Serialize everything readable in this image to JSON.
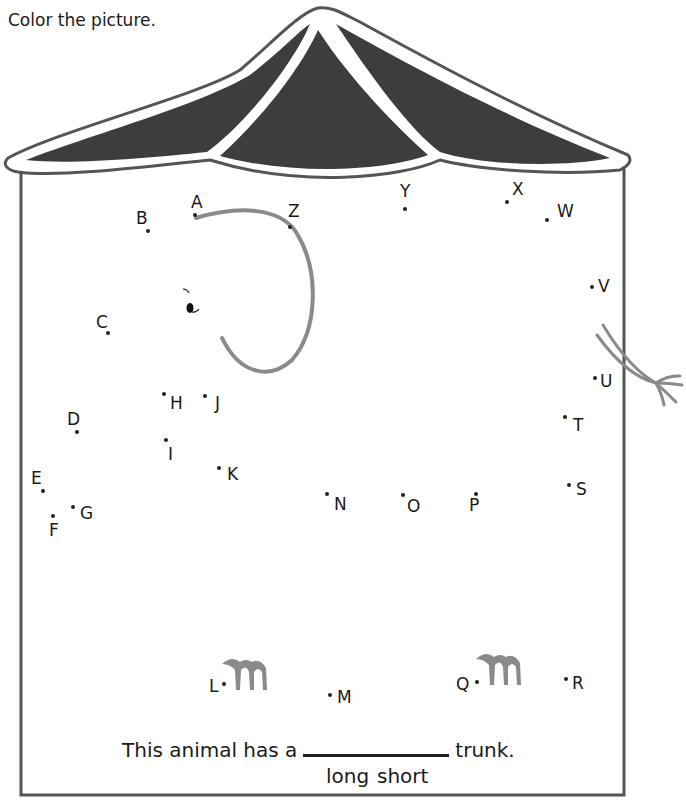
{
  "worksheet": {
    "instruction": "Color the picture.",
    "sentence": {
      "before": "This animal has a",
      "after": "trunk.",
      "choices": [
        "long",
        "short"
      ]
    },
    "colors": {
      "roof_fill": "#3d3d3d",
      "outline": "#555555",
      "trunk_gray": "#8a8a8a",
      "ink": "#1a1a1a"
    },
    "dots": [
      {
        "label": "A",
        "x": 195,
        "y": 215,
        "lx": 191,
        "ly": 194
      },
      {
        "label": "B",
        "x": 148,
        "y": 231,
        "lx": 136,
        "ly": 210
      },
      {
        "label": "C",
        "x": 108,
        "y": 333,
        "lx": 96,
        "ly": 314
      },
      {
        "label": "D",
        "x": 77,
        "y": 432,
        "lx": 67,
        "ly": 411
      },
      {
        "label": "E",
        "x": 43,
        "y": 491,
        "lx": 31,
        "ly": 470
      },
      {
        "label": "F",
        "x": 53,
        "y": 516,
        "lx": 49,
        "ly": 522
      },
      {
        "label": "G",
        "x": 73,
        "y": 507,
        "lx": 80,
        "ly": 505
      },
      {
        "label": "H",
        "x": 164,
        "y": 394,
        "lx": 170,
        "ly": 395
      },
      {
        "label": "I",
        "x": 166,
        "y": 440,
        "lx": 168,
        "ly": 446
      },
      {
        "label": "J",
        "x": 205,
        "y": 396,
        "lx": 215,
        "ly": 395
      },
      {
        "label": "K",
        "x": 219,
        "y": 468,
        "lx": 227,
        "ly": 466
      },
      {
        "label": "L",
        "x": 224,
        "y": 684,
        "lx": 209,
        "ly": 678
      },
      {
        "label": "M",
        "x": 330,
        "y": 695,
        "lx": 337,
        "ly": 689
      },
      {
        "label": "N",
        "x": 327,
        "y": 494,
        "lx": 334,
        "ly": 496
      },
      {
        "label": "O",
        "x": 403,
        "y": 495,
        "lx": 407,
        "ly": 498
      },
      {
        "label": "P",
        "x": 476,
        "y": 494,
        "lx": 469,
        "ly": 497
      },
      {
        "label": "Q",
        "x": 477,
        "y": 682,
        "lx": 456,
        "ly": 676
      },
      {
        "label": "R",
        "x": 566,
        "y": 679,
        "lx": 572,
        "ly": 675
      },
      {
        "label": "S",
        "x": 569,
        "y": 485,
        "lx": 576,
        "ly": 481
      },
      {
        "label": "T",
        "x": 565,
        "y": 417,
        "lx": 573,
        "ly": 417
      },
      {
        "label": "U",
        "x": 595,
        "y": 378,
        "lx": 600,
        "ly": 373
      },
      {
        "label": "V",
        "x": 592,
        "y": 287,
        "lx": 598,
        "ly": 278
      },
      {
        "label": "W",
        "x": 547,
        "y": 220,
        "lx": 557,
        "ly": 203
      },
      {
        "label": "X",
        "x": 507,
        "y": 202,
        "lx": 512,
        "ly": 181
      },
      {
        "label": "Y",
        "x": 405,
        "y": 209,
        "lx": 400,
        "ly": 183
      },
      {
        "label": "Z",
        "x": 290,
        "y": 227,
        "lx": 288,
        "ly": 203
      }
    ]
  }
}
